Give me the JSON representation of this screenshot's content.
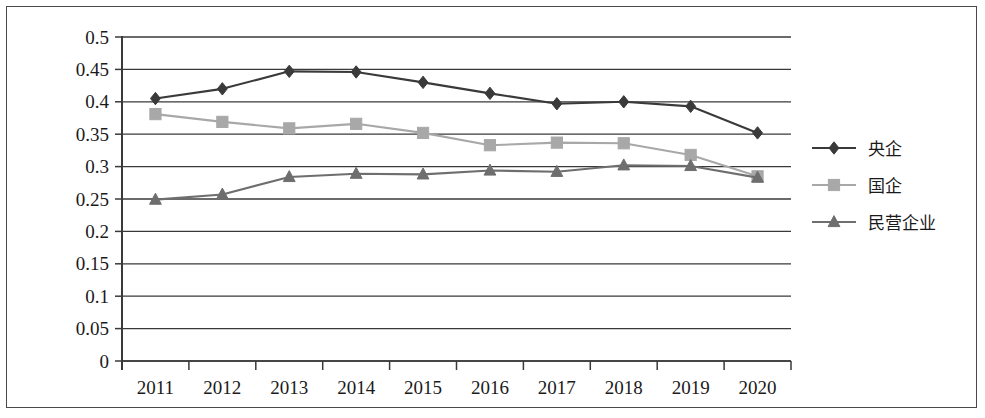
{
  "chart_data": {
    "type": "line",
    "title": "",
    "xlabel": "",
    "ylabel": "",
    "categories": [
      "2011",
      "2012",
      "2013",
      "2014",
      "2015",
      "2016",
      "2017",
      "2018",
      "2019",
      "2020"
    ],
    "x": [
      2011,
      2012,
      2013,
      2014,
      2015,
      2016,
      2017,
      2018,
      2019,
      2020
    ],
    "ylim": [
      0,
      0.5
    ],
    "ytick_labels": [
      "0",
      "0.05",
      "0.1",
      "0.15",
      "0.2",
      "0.25",
      "0.3",
      "0.35",
      "0.4",
      "0.45",
      "0.5"
    ],
    "ytick_values": [
      0,
      0.05,
      0.1,
      0.15,
      0.2,
      0.25,
      0.3,
      0.35,
      0.4,
      0.45,
      0.5
    ],
    "grid": "horizontal",
    "legend_position": "right",
    "series": [
      {
        "name": "央企",
        "marker": "diamond",
        "color": "#3a3a3a",
        "values": [
          0.405,
          0.42,
          0.447,
          0.446,
          0.43,
          0.413,
          0.397,
          0.4,
          0.393,
          0.352
        ]
      },
      {
        "name": "国企",
        "marker": "square",
        "color": "#a8a8a8",
        "values": [
          0.381,
          0.369,
          0.359,
          0.366,
          0.352,
          0.333,
          0.337,
          0.336,
          0.318,
          0.285
        ]
      },
      {
        "name": "民营企业",
        "marker": "triangle",
        "color": "#6e6e6e",
        "values": [
          0.249,
          0.257,
          0.284,
          0.289,
          0.288,
          0.294,
          0.292,
          0.302,
          0.301,
          0.283
        ]
      }
    ]
  },
  "legend": {
    "items": [
      {
        "label": "央企",
        "marker": "diamond",
        "color": "#3a3a3a"
      },
      {
        "label": "国企",
        "marker": "square",
        "color": "#a8a8a8"
      },
      {
        "label": "民营企业",
        "marker": "triangle",
        "color": "#6e6e6e"
      }
    ]
  },
  "axes": {
    "axis_color": "#3a3a3a",
    "grid_color": "#3a3a3a"
  }
}
